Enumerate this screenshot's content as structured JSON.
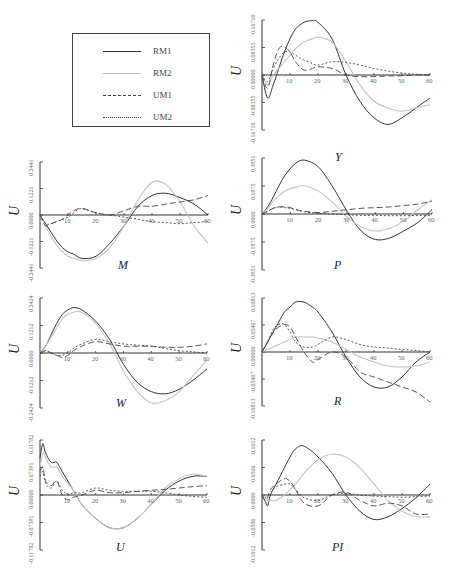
{
  "legend": {
    "items": [
      {
        "label": "RM1",
        "style": "solid",
        "color": "#333333"
      },
      {
        "label": "RM2",
        "style": "solid",
        "color": "#bbbbbb"
      },
      {
        "label": "UM1",
        "style": "dashed",
        "color": "#444444"
      },
      {
        "label": "UM2",
        "style": "dotted",
        "color": "#444444"
      }
    ]
  },
  "chart_data": [
    {
      "type": "line",
      "title": "Y",
      "xlabel": "",
      "ylabel": "U",
      "x": [
        0,
        2,
        4,
        6,
        8,
        10,
        12,
        15,
        18,
        20,
        25,
        30,
        35,
        40,
        45,
        50,
        55,
        60
      ],
      "yticks": [
        "-0.16710",
        "-0.08355",
        "0.00000",
        "0.08355",
        "0.16710"
      ],
      "xticks": [
        "10",
        "20",
        "30",
        "40",
        "50",
        "60"
      ],
      "ylim": [
        -0.1671,
        0.1671
      ],
      "series": [
        {
          "name": "RM1",
          "values": [
            0,
            -0.07,
            -0.03,
            0.02,
            0.07,
            0.11,
            0.14,
            0.16,
            0.165,
            0.16,
            0.11,
            0.0,
            -0.08,
            -0.13,
            -0.15,
            -0.13,
            -0.1,
            -0.07
          ]
        },
        {
          "name": "RM2",
          "values": [
            0,
            -0.03,
            0,
            0.02,
            0.04,
            0.06,
            0.08,
            0.1,
            0.11,
            0.115,
            0.1,
            0.04,
            -0.03,
            -0.08,
            -0.1,
            -0.11,
            -0.1,
            -0.09
          ]
        },
        {
          "name": "UM1",
          "values": [
            0,
            -0.04,
            0.03,
            0.08,
            0.085,
            0.07,
            0.04,
            0.015,
            0.02,
            0.025,
            0.02,
            0.0,
            -0.005,
            -0.005,
            -0.003,
            -0.002,
            0,
            0
          ]
        },
        {
          "name": "UM2",
          "values": [
            0,
            -0.02,
            0.02,
            0.05,
            0.07,
            0.07,
            0.06,
            0.045,
            0.035,
            0.03,
            0.04,
            0.038,
            0.03,
            0.02,
            0.012,
            0.006,
            0.002,
            0
          ]
        }
      ]
    },
    {
      "type": "line",
      "title": "M",
      "xlabel": "",
      "ylabel": "U",
      "x": [
        0,
        2,
        4,
        6,
        8,
        10,
        12,
        15,
        20,
        25,
        30,
        35,
        40,
        45,
        50,
        55,
        60
      ],
      "yticks": [
        "-0.2441",
        "-0.1221",
        "0.0000",
        "0.1221",
        "0.2441"
      ],
      "xticks": [
        "10",
        "20",
        "30",
        "40",
        "50",
        "60"
      ],
      "ylim": [
        -0.2441,
        0.2441
      ],
      "series": [
        {
          "name": "RM1",
          "values": [
            0,
            -0.04,
            -0.08,
            -0.12,
            -0.15,
            -0.17,
            -0.18,
            -0.2,
            -0.19,
            -0.13,
            -0.05,
            0.04,
            0.09,
            0.1,
            0.08,
            0.05,
            0
          ]
        },
        {
          "name": "RM2",
          "values": [
            0,
            -0.05,
            -0.1,
            -0.14,
            -0.17,
            -0.19,
            -0.2,
            -0.21,
            -0.2,
            -0.15,
            -0.05,
            0.07,
            0.15,
            0.14,
            0.06,
            -0.05,
            -0.13
          ]
        },
        {
          "name": "UM1",
          "values": [
            0,
            -0.05,
            -0.04,
            -0.03,
            -0.02,
            0.0,
            0.02,
            0.03,
            0.01,
            0.0,
            0.02,
            0.04,
            0.04,
            0.05,
            0.06,
            0.07,
            0.09
          ]
        },
        {
          "name": "UM2",
          "values": [
            0,
            -0.04,
            -0.04,
            -0.03,
            -0.02,
            -0.01,
            0.01,
            0.03,
            0.01,
            0.0,
            -0.01,
            -0.02,
            -0.03,
            -0.035,
            -0.04,
            -0.035,
            -0.03
          ]
        }
      ]
    },
    {
      "type": "line",
      "title": "P",
      "xlabel": "",
      "ylabel": "U",
      "x": [
        0,
        2,
        4,
        6,
        8,
        10,
        12,
        15,
        20,
        25,
        30,
        35,
        40,
        45,
        50,
        55,
        60
      ],
      "yticks": [
        "-0.3951",
        "-0.1975",
        "0.0000",
        "0.1975",
        "0.3951"
      ],
      "xticks": [
        "10",
        "20",
        "30",
        "40",
        "50",
        "60"
      ],
      "ylim": [
        -0.3951,
        0.3951
      ],
      "series": [
        {
          "name": "RM1",
          "values": [
            0,
            0.05,
            0.12,
            0.2,
            0.27,
            0.32,
            0.36,
            0.38,
            0.33,
            0.19,
            0.02,
            -0.12,
            -0.18,
            -0.17,
            -0.12,
            -0.06,
            0.03
          ]
        },
        {
          "name": "RM2",
          "values": [
            0,
            0.04,
            0.09,
            0.13,
            0.16,
            0.18,
            0.19,
            0.2,
            0.16,
            0.08,
            -0.02,
            -0.09,
            -0.12,
            -0.1,
            -0.05,
            0.03,
            0.1
          ]
        },
        {
          "name": "UM1",
          "values": [
            0,
            0.02,
            0.04,
            0.05,
            0.05,
            0.045,
            0.03,
            0.02,
            0.01,
            0.02,
            0.03,
            0.04,
            0.045,
            0.05,
            0.06,
            0.07,
            0.09
          ]
        },
        {
          "name": "UM2",
          "values": [
            0,
            0.02,
            0.04,
            0.05,
            0.045,
            0.04,
            0.03,
            0.015,
            0.005,
            0.0,
            -0.005,
            -0.01,
            -0.01,
            -0.012,
            -0.012,
            -0.01,
            -0.01
          ]
        }
      ]
    },
    {
      "type": "line",
      "title": "W",
      "xlabel": "",
      "ylabel": "U",
      "x": [
        0,
        2,
        4,
        6,
        8,
        10,
        12,
        15,
        20,
        25,
        30,
        35,
        40,
        45,
        50,
        55,
        60
      ],
      "yticks": [
        "-0.2424",
        "-0.1212",
        "0.0000",
        "0.1212",
        "0.2424"
      ],
      "xticks": [
        "10",
        "20",
        "30",
        "40",
        "50",
        "60"
      ],
      "ylim": [
        -0.2424,
        0.2424
      ],
      "series": [
        {
          "name": "RM1",
          "values": [
            0,
            0.03,
            0.08,
            0.13,
            0.17,
            0.19,
            0.2,
            0.19,
            0.14,
            0.06,
            -0.05,
            -0.13,
            -0.17,
            -0.18,
            -0.16,
            -0.12,
            -0.07
          ]
        },
        {
          "name": "RM2",
          "values": [
            0,
            0.03,
            0.07,
            0.11,
            0.15,
            0.17,
            0.18,
            0.18,
            0.13,
            0.04,
            -0.08,
            -0.17,
            -0.22,
            -0.21,
            -0.17,
            -0.1,
            -0.03
          ]
        },
        {
          "name": "UM1",
          "values": [
            0,
            0.01,
            0.0,
            -0.01,
            -0.02,
            -0.01,
            0.01,
            0.03,
            0.05,
            0.04,
            0.03,
            0.03,
            0.03,
            0.025,
            0.025,
            0.03,
            0.04
          ]
        },
        {
          "name": "UM2",
          "values": [
            0,
            0.01,
            0.0,
            -0.01,
            -0.01,
            0.0,
            0.02,
            0.04,
            0.06,
            0.05,
            0.04,
            0.035,
            0.03,
            0.02,
            0.01,
            0.005,
            0.0
          ]
        }
      ]
    },
    {
      "type": "line",
      "title": "R",
      "xlabel": "",
      "ylabel": "U",
      "x": [
        0,
        2,
        4,
        6,
        8,
        10,
        12,
        15,
        18,
        20,
        25,
        30,
        35,
        40,
        45,
        50,
        55,
        60
      ],
      "yticks": [
        "-0.10813",
        "-0.05407",
        "0.00000",
        "0.05407",
        "0.10813"
      ],
      "xticks": [
        "10",
        "20",
        "30",
        "40",
        "50",
        "60"
      ],
      "ylim": [
        -0.10813,
        0.10813
      ],
      "series": [
        {
          "name": "RM1",
          "values": [
            0,
            0.02,
            0.04,
            0.06,
            0.08,
            0.09,
            0.1,
            0.1,
            0.09,
            0.08,
            0.04,
            -0.01,
            -0.05,
            -0.07,
            -0.07,
            -0.05,
            -0.02,
            0.0
          ]
        },
        {
          "name": "RM2",
          "values": [
            0,
            0.005,
            0.01,
            0.015,
            0.02,
            0.025,
            0.03,
            0.03,
            0.03,
            0.028,
            0.02,
            0.005,
            -0.01,
            -0.02,
            -0.028,
            -0.03,
            -0.028,
            -0.02
          ]
        },
        {
          "name": "UM1",
          "values": [
            0,
            0.02,
            0.04,
            0.05,
            0.055,
            0.05,
            0.03,
            0.0,
            -0.02,
            -0.015,
            0.0,
            -0.01,
            -0.04,
            -0.05,
            -0.06,
            -0.07,
            -0.08,
            -0.1
          ]
        },
        {
          "name": "UM2",
          "values": [
            0,
            0.02,
            0.045,
            0.055,
            0.055,
            0.04,
            0.02,
            0.01,
            0.01,
            0.015,
            0.03,
            0.025,
            0.015,
            0.01,
            0.008,
            0.005,
            0.003,
            0.0
          ]
        }
      ]
    },
    {
      "type": "line",
      "title": "U",
      "xlabel": "",
      "ylabel": "U",
      "x": [
        0,
        1,
        2,
        4,
        6,
        8,
        10,
        12,
        15,
        20,
        25,
        30,
        35,
        40,
        45,
        50,
        55,
        60
      ],
      "yticks": [
        "-0.11782",
        "-0.07391",
        "0.00000",
        "0.07391",
        "0.11782"
      ],
      "xticks": [
        "10",
        "20",
        "30",
        "40",
        "50",
        "60"
      ],
      "ylim": [
        -0.11782,
        0.11782
      ],
      "series": [
        {
          "name": "RM1",
          "values": [
            0.08,
            0.11,
            0.09,
            0.07,
            0.07,
            0.05,
            0.03,
            0.01,
            -0.02,
            -0.05,
            -0.07,
            -0.07,
            -0.05,
            -0.02,
            0.01,
            0.03,
            0.04,
            0.04
          ]
        },
        {
          "name": "RM2",
          "values": [
            0.06,
            0.09,
            0.08,
            0.06,
            0.06,
            0.04,
            0.025,
            0.01,
            -0.02,
            -0.05,
            -0.07,
            -0.07,
            -0.05,
            -0.02,
            0.015,
            0.035,
            0.045,
            0.04
          ]
        },
        {
          "name": "UM1",
          "values": [
            0.05,
            0.06,
            0.03,
            0.02,
            0.03,
            0.0,
            -0.01,
            -0.005,
            0.0,
            0.01,
            0.005,
            0.005,
            0.008,
            0.01,
            0.012,
            0.015,
            0.018,
            0.02
          ]
        },
        {
          "name": "UM2",
          "values": [
            0.04,
            0.05,
            0.025,
            0.015,
            0.03,
            0.01,
            0.0,
            0.005,
            0.005,
            0.015,
            0.01,
            0.008,
            0.008,
            0.008,
            0.005,
            0.0,
            -0.003,
            -0.005
          ]
        }
      ]
    },
    {
      "type": "line",
      "title": "PI",
      "xlabel": "",
      "ylabel": "U",
      "x": [
        0,
        1,
        2,
        3,
        5,
        8,
        10,
        12,
        15,
        20,
        25,
        30,
        35,
        40,
        45,
        50,
        55,
        60
      ],
      "yticks": [
        "-0.1012",
        "-0.0506",
        "0.0000",
        "0.0506",
        "0.1012"
      ],
      "xticks": [
        "10",
        "20",
        "30",
        "40",
        "50",
        "60"
      ],
      "ylim": [
        -0.1012,
        0.1012
      ],
      "series": [
        {
          "name": "RM1",
          "values": [
            0,
            -0.01,
            -0.02,
            0.0,
            0.02,
            0.05,
            0.07,
            0.085,
            0.09,
            0.07,
            0.04,
            0.0,
            -0.03,
            -0.045,
            -0.04,
            -0.025,
            -0.005,
            0.02
          ]
        },
        {
          "name": "RM2",
          "values": [
            0,
            -0.005,
            -0.01,
            -0.01,
            -0.01,
            0.0,
            0.01,
            0.02,
            0.04,
            0.065,
            0.075,
            0.07,
            0.05,
            0.02,
            -0.01,
            -0.03,
            -0.04,
            -0.04
          ]
        },
        {
          "name": "UM1",
          "values": [
            0,
            -0.01,
            -0.005,
            0.01,
            0.02,
            0.03,
            0.025,
            0.01,
            -0.015,
            -0.02,
            0.0,
            0.005,
            -0.01,
            -0.02,
            -0.015,
            -0.02,
            -0.035,
            -0.035
          ]
        },
        {
          "name": "UM2",
          "values": [
            0,
            -0.005,
            0.0,
            0.005,
            0.015,
            0.02,
            0.02,
            0.01,
            -0.005,
            -0.01,
            0.0,
            0.003,
            0.0,
            -0.002,
            -0.003,
            -0.004,
            -0.003,
            -0.002
          ]
        }
      ]
    }
  ]
}
